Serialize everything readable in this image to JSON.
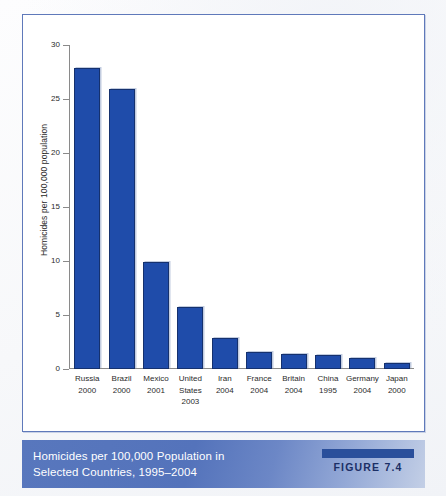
{
  "chart_data": {
    "type": "bar",
    "title": "",
    "xlabel": "",
    "ylabel": "Homicides per 100,000 population",
    "ylim": [
      0,
      30
    ],
    "ytick_step": 5,
    "yticks": [
      30,
      25,
      20,
      15,
      10,
      5,
      0
    ],
    "grid": false,
    "legend": null,
    "categories": [
      "Russia 2000",
      "Brazil 2000",
      "Mexico 2001",
      "United States 2003",
      "Iran 2004",
      "France 2004",
      "Britain 2004",
      "China 1995",
      "Germany 2004",
      "Japan 2000"
    ],
    "category_lines": [
      [
        "Russia",
        "2000"
      ],
      [
        "Brazil",
        "2000"
      ],
      [
        "Mexico",
        "2001"
      ],
      [
        "United",
        "States",
        "2003"
      ],
      [
        "Iran",
        "2004"
      ],
      [
        "France",
        "2004"
      ],
      [
        "Britain",
        "2004"
      ],
      [
        "China",
        "1995"
      ],
      [
        "Germany",
        "2004"
      ],
      [
        "Japan",
        "2000"
      ]
    ],
    "values": [
      27.9,
      25.9,
      9.9,
      5.7,
      2.9,
      1.6,
      1.4,
      1.3,
      1.0,
      0.6
    ],
    "bar_color": "#1f4caa",
    "bar_edge_color": "#15316e"
  },
  "caption": {
    "line1": "Homicides per 100,000 Population in",
    "line2": "Selected Countries, 1995–2004",
    "figure_label": "FIGURE 7.4",
    "band_color": "#5473bb",
    "badge_color": "#2a4f9b"
  },
  "frame": {
    "border_color": "#5f79ba"
  }
}
